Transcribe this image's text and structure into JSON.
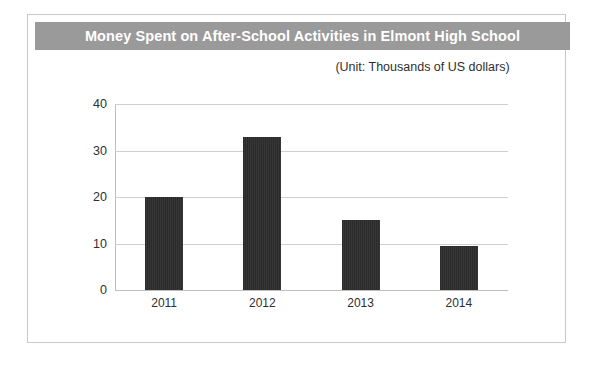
{
  "chart_data": {
    "type": "bar",
    "title": "Money Spent on After-School Activities in Elmont High School",
    "subtitle": "(Unit: Thousands of US dollars)",
    "categories": [
      "2011",
      "2012",
      "2013",
      "2014"
    ],
    "values": [
      20,
      33,
      15,
      9.5
    ],
    "xlabel": "",
    "ylabel": "",
    "ylim": [
      0,
      40
    ],
    "yticks": [
      "0",
      "10",
      "20",
      "30",
      "40"
    ],
    "ytick_values": [
      0,
      10,
      20,
      30,
      40
    ],
    "grid": true,
    "legend": false,
    "series": [
      {
        "name": "Money Spent",
        "values": [
          20,
          33,
          15,
          9.5
        ]
      }
    ],
    "colors": {
      "bar": "#2b2b2b",
      "title_banner": "#9a9a9a",
      "title_text": "#ffffff",
      "gridline": "#cfcfcf",
      "axis": "#bdbdbd",
      "frame": "#c9c9c9",
      "background": "#ffffff",
      "text": "#2f2f2f"
    }
  }
}
